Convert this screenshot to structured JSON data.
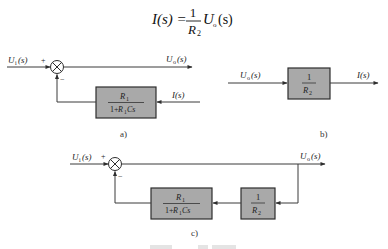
{
  "formula": {
    "lhs": "I(s) =",
    "numerator": "1",
    "denominator_base": "R",
    "denominator_sub": "2",
    "rhs_base": "U",
    "rhs_sub": "o",
    "rhs_arg": "(s)"
  },
  "diagram_a": {
    "input_label_base": "U",
    "input_label_sub": "i",
    "input_label_arg": "(s)",
    "plus_sign": "+",
    "minus_sign": "−",
    "output_label_base": "U",
    "output_label_sub": "o",
    "output_label_arg": "(s)",
    "feedback_input_label": "I(s)",
    "block_numerator_base": "R",
    "block_numerator_sub": "1",
    "block_denominator_prefix": "1+",
    "block_denominator_base": "R",
    "block_denominator_sub": "1",
    "block_denominator_suffix": "Cs",
    "caption": "a)"
  },
  "diagram_b": {
    "input_label_base": "U",
    "input_label_sub": "o",
    "input_label_arg": "(s)",
    "block_numerator": "1",
    "block_denominator_base": "R",
    "block_denominator_sub": "2",
    "output_label": "I(s)",
    "caption": "b)"
  },
  "diagram_c": {
    "input_label_base": "U",
    "input_label_sub": "i",
    "input_label_arg": "(s)",
    "plus_sign": "+",
    "minus_sign": "−",
    "output_label_base": "U",
    "output_label_sub": "o",
    "output_label_arg": "(s)",
    "block1_numerator_base": "R",
    "block1_numerator_sub": "1",
    "block1_denominator_prefix": "1+",
    "block1_denominator_base": "R",
    "block1_denominator_sub": "1",
    "block1_denominator_suffix": "Cs",
    "block2_numerator": "1",
    "block2_denominator_base": "R",
    "block2_denominator_sub": "2",
    "caption": "c)"
  },
  "colors": {
    "block_fill": "#a9a9a9",
    "line": "#3a3a3a",
    "background": "#ffffff"
  }
}
